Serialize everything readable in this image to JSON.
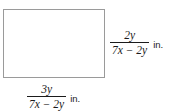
{
  "figure": {
    "type": "rectangle-diagram",
    "shape_name": "rectangle",
    "border_color": "#9a9a9a",
    "fill_color": "#ffffff",
    "text_color": "#1b1b1b"
  },
  "labels": {
    "height": {
      "numerator": "2y",
      "denominator": "7x − 2y",
      "unit": "in.",
      "position": "right"
    },
    "width": {
      "numerator": "3y",
      "denominator": "7x − 2y",
      "unit": "in.",
      "position": "bottom"
    }
  }
}
